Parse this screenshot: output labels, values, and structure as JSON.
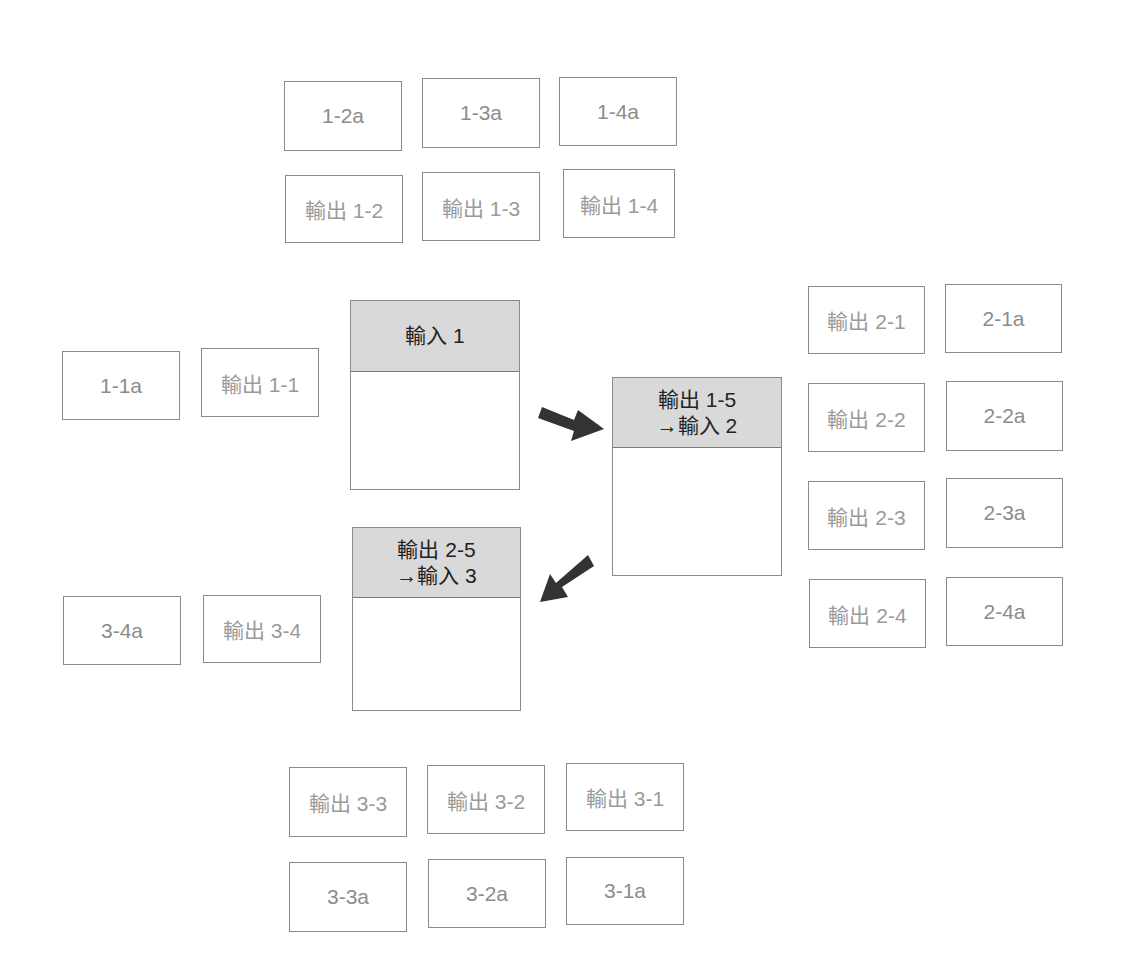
{
  "diagram": {
    "stages": [
      {
        "id": "stage-1",
        "header_lines": [
          "輸入 1"
        ],
        "box": {
          "x": 350,
          "y": 300,
          "w": 170,
          "h": 190,
          "header_h": 70
        }
      },
      {
        "id": "stage-2",
        "header_lines": [
          "輸出 1-5",
          "→輸入 2"
        ],
        "box": {
          "x": 612,
          "y": 377,
          "w": 170,
          "h": 199,
          "header_h": 69
        }
      },
      {
        "id": "stage-3",
        "header_lines": [
          "輸出 2-5",
          "→輸入 3"
        ],
        "box": {
          "x": 352,
          "y": 527,
          "w": 169,
          "h": 184,
          "header_h": 69
        }
      }
    ],
    "outputs": {
      "stage_1": [
        {
          "label": "輸出 1-1",
          "x": 201,
          "y": 348
        },
        {
          "label": "輸出 1-2",
          "x": 285,
          "y": 175
        },
        {
          "label": "輸出 1-3",
          "x": 422,
          "y": 172
        },
        {
          "label": "輸出 1-4",
          "x": 563,
          "y": 169
        }
      ],
      "stage_2": [
        {
          "label": "輸出 2-1",
          "x": 808,
          "y": 286
        },
        {
          "label": "輸出 2-2",
          "x": 808,
          "y": 383
        },
        {
          "label": "輸出 2-3",
          "x": 808,
          "y": 481
        },
        {
          "label": "輸出 2-4",
          "x": 809,
          "y": 579
        }
      ],
      "stage_3": [
        {
          "label": "輸出 3-1",
          "x": 566,
          "y": 763
        },
        {
          "label": "輸出 3-2",
          "x": 427,
          "y": 765
        },
        {
          "label": "輸出 3-3",
          "x": 289,
          "y": 767
        },
        {
          "label": "輸出 3-4",
          "x": 203,
          "y": 595
        }
      ]
    },
    "answers": {
      "stage_1": [
        {
          "label": "1-1a",
          "x": 62,
          "y": 351
        },
        {
          "label": "1-2a",
          "x": 284,
          "y": 81
        },
        {
          "label": "1-3a",
          "x": 422,
          "y": 78
        },
        {
          "label": "1-4a",
          "x": 559,
          "y": 77
        }
      ],
      "stage_2": [
        {
          "label": "2-1a",
          "x": 945,
          "y": 284
        },
        {
          "label": "2-2a",
          "x": 946,
          "y": 381
        },
        {
          "label": "2-3a",
          "x": 946,
          "y": 478
        },
        {
          "label": "2-4a",
          "x": 946,
          "y": 577
        }
      ],
      "stage_3": [
        {
          "label": "3-1a",
          "x": 566,
          "y": 857
        },
        {
          "label": "3-2a",
          "x": 428,
          "y": 859
        },
        {
          "label": "3-3a",
          "x": 289,
          "y": 862
        },
        {
          "label": "3-4a",
          "x": 63,
          "y": 596
        }
      ]
    },
    "arrows": [
      {
        "from": "stage-1",
        "to": "stage-2",
        "direction": "down-right",
        "color": "#333333"
      },
      {
        "from": "stage-2",
        "to": "stage-3",
        "direction": "down-left",
        "color": "#333333"
      }
    ],
    "colors": {
      "header_fill": "#d9d9d9",
      "border": "#8a8a8a",
      "small_text": "#8c8c8c",
      "header_text": "#222222",
      "arrow": "#333333"
    }
  }
}
